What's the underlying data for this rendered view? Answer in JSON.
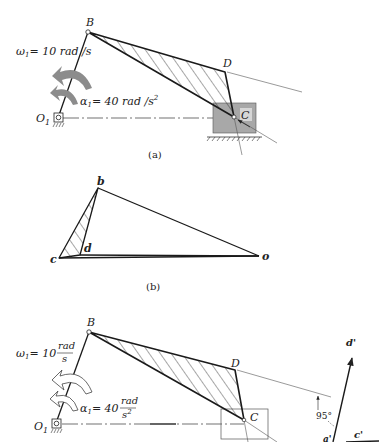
{
  "figure_a": {
    "caption": "(a)",
    "points": {
      "B": "B",
      "D": "D",
      "C": "C",
      "O1": "O",
      "O1_sub": "1"
    },
    "omega_label": "ω",
    "omega_sub": "1",
    "omega_text": "= 10 rad /s",
    "alpha_label": "α",
    "alpha_sub": "1",
    "alpha_text": "= 40 rad /s",
    "alpha_exp": "2"
  },
  "figure_b": {
    "caption": "(b)",
    "points": {
      "b": "b",
      "c": "c",
      "d": "d",
      "o": "o"
    }
  },
  "figure_c": {
    "points": {
      "B": "B",
      "D": "D",
      "C": "C",
      "O1": "O",
      "O1_sub": "1",
      "d_prime": "d'",
      "c_prime": "c'",
      "a_prime": "a'"
    },
    "omega_label": "ω",
    "omega_sub": "1",
    "omega_value": "= 10",
    "omega_num": "rad",
    "omega_den": "s",
    "alpha_label": "α",
    "alpha_sub": "1",
    "alpha_value": "= 40",
    "alpha_num": "rad",
    "alpha_den": "s",
    "alpha_den_exp": "2",
    "angle_label": "95°"
  },
  "colors": {
    "line": "#1a1a1a",
    "slider_fill": "#a8a8a8",
    "arrow_fill": "#8c8c8c",
    "thin_line": "#555555"
  }
}
